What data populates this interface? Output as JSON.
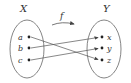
{
  "diagram": {
    "function_label": "f",
    "domain": {
      "name": "X",
      "elements": [
        "a",
        "b",
        "c"
      ]
    },
    "codomain": {
      "name": "Y",
      "elements": [
        "x",
        "y",
        "z"
      ]
    },
    "mapping": [
      {
        "from": "a",
        "to": "z"
      },
      {
        "from": "b",
        "to": "x"
      },
      {
        "from": "c",
        "to": "y"
      }
    ],
    "colors": {
      "stroke": "#555555",
      "text": "#333333"
    }
  }
}
